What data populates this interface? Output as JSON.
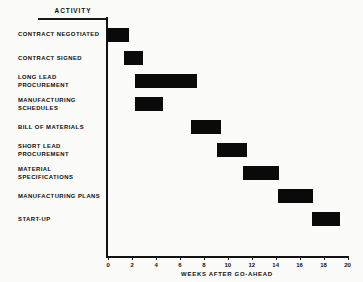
{
  "header": {
    "activity_column_label": "ACTIVITY"
  },
  "chart_data": {
    "type": "bar",
    "title": "",
    "subtitle": "",
    "orientation": "horizontal",
    "chart_kind": "gantt",
    "xlabel": "WEEKS AFTER GO-AHEAD",
    "ylabel": "ACTIVITY",
    "xlim": [
      0,
      20
    ],
    "xticks": [
      0,
      2,
      4,
      6,
      8,
      10,
      12,
      14,
      16,
      18,
      20
    ],
    "xtick_labels": [
      "0",
      "2",
      "4",
      "6",
      "8",
      "10",
      "12",
      "14",
      "16",
      "18",
      "20"
    ],
    "grid": false,
    "legend": "none",
    "bar_color": "#0a0a0a",
    "axis_color": "#111111",
    "background_color": "#fbfbf9",
    "categories": [
      "CONTRACT NEGOTIATED",
      "CONTRACT SIGNED",
      "LONG LEAD\nPROCUREMENT",
      "MANUFACTURING\nSCHEDULES",
      "BILL OF MATERIALS",
      "SHORT LEAD\nPROCUREMENT",
      "MATERIAL\nSPECIFICATIONS",
      "MANUFACTURING PLANS",
      "START-UP"
    ],
    "tasks": [
      {
        "label": "CONTRACT NEGOTIATED",
        "start": 0.0,
        "end": 1.7,
        "duration": 1.7
      },
      {
        "label": "CONTRACT SIGNED",
        "start": 1.3,
        "end": 2.9,
        "duration": 1.6
      },
      {
        "label": "LONG LEAD\nPROCUREMENT",
        "start": 2.2,
        "end": 7.4,
        "duration": 5.2
      },
      {
        "label": "MANUFACTURING\nSCHEDULES",
        "start": 2.2,
        "end": 4.6,
        "duration": 2.4
      },
      {
        "label": "BILL OF MATERIALS",
        "start": 6.9,
        "end": 9.4,
        "duration": 2.5
      },
      {
        "label": "SHORT LEAD\nPROCUREMENT",
        "start": 9.1,
        "end": 11.6,
        "duration": 2.5
      },
      {
        "label": "MATERIAL\nSPECIFICATIONS",
        "start": 11.3,
        "end": 14.3,
        "duration": 3.0
      },
      {
        "label": "MANUFACTURING PLANS",
        "start": 14.2,
        "end": 17.1,
        "duration": 2.9
      },
      {
        "label": "START-UP",
        "start": 17.0,
        "end": 19.4,
        "duration": 2.4
      }
    ]
  }
}
